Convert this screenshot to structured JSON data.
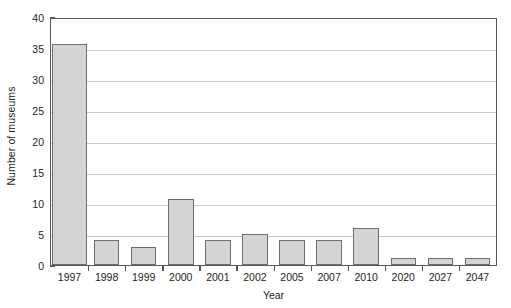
{
  "chart_data": {
    "type": "bar",
    "title": "",
    "xlabel": "Year",
    "ylabel": "Number of museums",
    "categories": [
      "1997",
      "1998",
      "1999",
      "2000",
      "2001",
      "2002",
      "2005",
      "2007",
      "2010",
      "2020",
      "2027",
      "2047"
    ],
    "values": [
      36,
      4,
      3,
      10.7,
      4,
      5,
      4,
      4,
      6,
      1.1,
      1.1,
      1.1
    ],
    "series": [
      {
        "name": "Number of museums",
        "values": [
          36,
          4,
          3,
          10.7,
          4,
          5,
          4,
          4,
          6,
          1.1,
          1.1,
          1.1
        ]
      }
    ],
    "ylim": [
      0,
      40
    ],
    "ytick_labels": [
      "0",
      "5",
      "10",
      "15",
      "20",
      "25",
      "30",
      "35",
      "40"
    ],
    "ytick_values": [
      0,
      5,
      10,
      15,
      20,
      25,
      30,
      35,
      40
    ],
    "grid": "horizontal",
    "legend": "none",
    "bar_fill_color": "#d4d5d3",
    "bar_edge_color": "#6d6e70",
    "gridline_color": "#c9cacc",
    "axis_color": "#58585a",
    "background_color": "#ffffff"
  }
}
